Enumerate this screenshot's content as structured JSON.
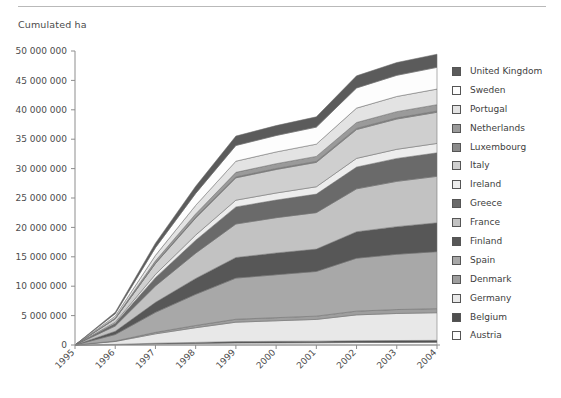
{
  "axis_title": "Cumulated ha",
  "colors": {
    "axis": "#8d8d8d",
    "text": "#4d4d4d",
    "rule": "#b9b9b9",
    "band_outline": "#6f6f6f"
  },
  "legend": {
    "position": "right",
    "items": [
      {
        "label": "United Kingdom",
        "color": "#5b5b5b"
      },
      {
        "label": "Sweden",
        "color": "#fdfdfd"
      },
      {
        "label": "Portugal",
        "color": "#e3e3e3"
      },
      {
        "label": "Netherlands",
        "color": "#9a9a9a"
      },
      {
        "label": "Luxembourg",
        "color": "#8a8a8a"
      },
      {
        "label": "Italy",
        "color": "#cfcfcf"
      },
      {
        "label": "Ireland",
        "color": "#ededed"
      },
      {
        "label": "Greece",
        "color": "#6a6a6a"
      },
      {
        "label": "France",
        "color": "#c2c2c2"
      },
      {
        "label": "Finland",
        "color": "#575757"
      },
      {
        "label": "Spain",
        "color": "#a8a8a8"
      },
      {
        "label": "Denmark",
        "color": "#9e9e9e"
      },
      {
        "label": "Germany",
        "color": "#e8e8e8"
      },
      {
        "label": "Belgium",
        "color": "#4f4f4f"
      },
      {
        "label": "Austria",
        "color": "#fbfbfb"
      }
    ]
  },
  "chart_data": {
    "type": "area",
    "stacked": true,
    "title": "",
    "subtitle": "",
    "xlabel": "",
    "ylabel": "Cumulated ha",
    "grid": false,
    "x": [
      "1995",
      "1996",
      "1997",
      "1998",
      "1999",
      "2000",
      "2001",
      "2002",
      "2003",
      "2004"
    ],
    "xtick_labels": [
      "1995",
      "1996",
      "1997",
      "1998",
      "1999",
      "2000",
      "2001",
      "2002",
      "2003",
      "2004"
    ],
    "ytick_labels": [
      "0",
      "5 000 000",
      "10 000 000",
      "15 000 000",
      "20 000 000",
      "25 000 000",
      "30 000 000",
      "35 000 000",
      "40 000 000",
      "45 000 000",
      "50 000 000"
    ],
    "ytick_values": [
      0,
      5000000,
      10000000,
      15000000,
      20000000,
      25000000,
      30000000,
      35000000,
      40000000,
      45000000,
      50000000
    ],
    "ylim": [
      0,
      50000000
    ],
    "y_unit": "ha",
    "stack_order_bottom_to_top": [
      "Austria",
      "Belgium",
      "Germany",
      "Denmark",
      "Spain",
      "Finland",
      "France",
      "Greece",
      "Ireland",
      "Italy",
      "Luxembourg",
      "Netherlands",
      "Portugal",
      "Sweden",
      "United Kingdom"
    ],
    "series": [
      {
        "name": "Austria",
        "color": "#fbfbfb",
        "values": [
          0,
          60000,
          180000,
          260000,
          340000,
          360000,
          380000,
          420000,
          440000,
          460000
        ]
      },
      {
        "name": "Belgium",
        "color": "#4f4f4f",
        "values": [
          0,
          40000,
          120000,
          180000,
          240000,
          260000,
          270000,
          300000,
          320000,
          330000
        ]
      },
      {
        "name": "Germany",
        "color": "#e8e8e8",
        "values": [
          0,
          500000,
          1600000,
          2500000,
          3300000,
          3500000,
          3700000,
          4400000,
          4600000,
          4700000
        ]
      },
      {
        "name": "Denmark",
        "color": "#9e9e9e",
        "values": [
          0,
          80000,
          250000,
          380000,
          500000,
          530000,
          560000,
          640000,
          670000,
          690000
        ]
      },
      {
        "name": "Spain",
        "color": "#a8a8a8",
        "values": [
          0,
          1100000,
          3400000,
          5300000,
          7000000,
          7300000,
          7600000,
          9000000,
          9400000,
          9700000
        ]
      },
      {
        "name": "Finland",
        "color": "#575757",
        "values": [
          0,
          550000,
          1700000,
          2700000,
          3500000,
          3700000,
          3800000,
          4500000,
          4700000,
          4900000
        ]
      },
      {
        "name": "France",
        "color": "#c2c2c2",
        "values": [
          0,
          900000,
          2800000,
          4300000,
          5700000,
          6000000,
          6200000,
          7300000,
          7700000,
          7900000
        ]
      },
      {
        "name": "Greece",
        "color": "#6a6a6a",
        "values": [
          0,
          450000,
          1400000,
          2200000,
          2900000,
          3000000,
          3150000,
          3700000,
          3900000,
          4000000
        ]
      },
      {
        "name": "Ireland",
        "color": "#ededed",
        "values": [
          0,
          180000,
          560000,
          870000,
          1150000,
          1200000,
          1250000,
          1480000,
          1550000,
          1600000
        ]
      },
      {
        "name": "Italy",
        "color": "#cfcfcf",
        "values": [
          0,
          600000,
          1850000,
          2900000,
          3800000,
          4000000,
          4150000,
          4900000,
          5150000,
          5300000
        ]
      },
      {
        "name": "Luxembourg",
        "color": "#8a8a8a",
        "values": [
          0,
          25000,
          75000,
          115000,
          150000,
          160000,
          165000,
          195000,
          205000,
          210000
        ]
      },
      {
        "name": "Netherlands",
        "color": "#9a9a9a",
        "values": [
          0,
          120000,
          380000,
          590000,
          780000,
          820000,
          850000,
          1000000,
          1050000,
          1080000
        ]
      },
      {
        "name": "Portugal",
        "color": "#e3e3e3",
        "values": [
          0,
          300000,
          930000,
          1450000,
          1900000,
          2000000,
          2080000,
          2450000,
          2580000,
          2650000
        ]
      },
      {
        "name": "Sweden",
        "color": "#fdfdfd",
        "values": [
          0,
          420000,
          1300000,
          2030000,
          2670000,
          2800000,
          2900000,
          3430000,
          3600000,
          3700000
        ]
      },
      {
        "name": "United Kingdom",
        "color": "#5b5b5b",
        "values": [
          0,
          250000,
          780000,
          1220000,
          1600000,
          1680000,
          1750000,
          2060000,
          2170000,
          2230000
        ]
      }
    ],
    "totals": [
      0,
      5575000,
      17225000,
      26995000,
      35530000,
      37310000,
      38755000,
      45575000,
      48035000,
      49450000
    ]
  }
}
